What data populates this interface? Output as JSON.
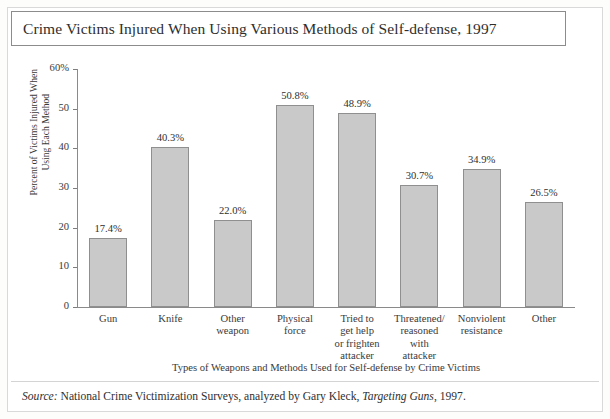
{
  "figure": {
    "title": "Crime Victims Injured When Using Various Methods of Self-defense, 1997",
    "source_prefix": "Source:",
    "source_body": " National Crime Victimization Surveys, analyzed by Gary Kleck, ",
    "source_italic_work": "Targeting Guns",
    "source_suffix": ", 1997."
  },
  "chart_data": {
    "type": "bar",
    "title": "Crime Victims Injured When Using Various Methods of Self-defense, 1997",
    "xlabel": "Types of Weapons and Methods Used for Self-defense by Crime Victims",
    "ylabel": "Percent of Victims Injured When Using Each Method",
    "ylabel_lines": [
      "Percent of Victims Injured When",
      "Using Each Method"
    ],
    "categories": [
      "Gun",
      "Knife",
      "Other weapon",
      "Physical force",
      "Tried to get help or frighten attacker",
      "Threatened/ reasoned with attacker",
      "Nonviolent resistance",
      "Other"
    ],
    "category_lines": [
      [
        "Gun"
      ],
      [
        "Knife"
      ],
      [
        "Other",
        "weapon"
      ],
      [
        "Physical",
        "force"
      ],
      [
        "Tried to",
        "get help",
        "or frighten",
        "attacker"
      ],
      [
        "Threatened/",
        "reasoned",
        "with",
        "attacker"
      ],
      [
        "Nonviolent",
        "resistance"
      ],
      [
        "Other"
      ]
    ],
    "values": [
      17.4,
      40.3,
      22.0,
      50.8,
      48.9,
      30.7,
      34.9,
      26.5
    ],
    "value_labels": [
      "17.4%",
      "40.3%",
      "22.0%",
      "50.8%",
      "48.9%",
      "30.7%",
      "34.9%",
      "26.5%"
    ],
    "ylim": [
      0,
      60
    ],
    "ytick_values": [
      0,
      10,
      20,
      30,
      40,
      50,
      60
    ],
    "ytick_labels": [
      "0",
      "10",
      "20",
      "30",
      "40",
      "50",
      "60%"
    ],
    "grid": false,
    "legend": false,
    "bar_color": "#c9c9c9",
    "bar_border_color": "#8f8f8f",
    "axis_color": "#8a8a8a",
    "background": "#ffffff"
  }
}
